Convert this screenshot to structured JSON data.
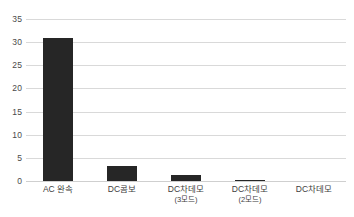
{
  "chart_data": {
    "type": "bar",
    "title": "",
    "subtitle": "",
    "xlabel": "",
    "ylabel": "",
    "categories": [
      "AC 완속",
      "DC콤보",
      "DC차데모",
      "DC차데모",
      "DC차데모"
    ],
    "category_sublabels": [
      "",
      "",
      "(3모드)",
      "(2모드)",
      ""
    ],
    "values": [
      31,
      3.2,
      1.2,
      0.3,
      0
    ],
    "ylim": [
      0,
      35
    ],
    "ytick_values": [
      0,
      5,
      10,
      15,
      20,
      25,
      30,
      35
    ],
    "ytick_labels": [
      "0",
      "5",
      "10",
      "15",
      "20",
      "25",
      "30",
      "35"
    ],
    "grid": true,
    "grid_axis": "y",
    "legend": false,
    "legend_position": "none",
    "bar_color": "#262626",
    "grid_color": "#d9d9d9",
    "background_color": "#ffffff",
    "axis_text_color": "#404040"
  }
}
